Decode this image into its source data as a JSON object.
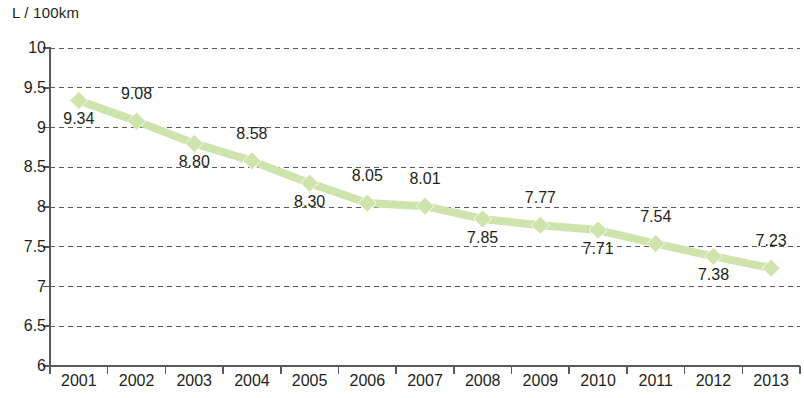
{
  "chart_data": {
    "type": "line",
    "title": "",
    "xlabel": "",
    "ylabel": "L / 100km",
    "ylim": [
      6,
      10
    ],
    "ytick_step": 0.5,
    "grid": true,
    "legend": null,
    "categories": [
      "2001",
      "2002",
      "2003",
      "2004",
      "2005",
      "2006",
      "2007",
      "2008",
      "2009",
      "2010",
      "2011",
      "2012",
      "2013"
    ],
    "values": [
      9.34,
      9.08,
      8.8,
      8.58,
      8.3,
      8.05,
      8.01,
      7.85,
      7.77,
      7.71,
      7.54,
      7.38,
      7.23
    ],
    "value_labels": [
      "9.34",
      "9.08",
      "8.80",
      "8.58",
      "8.30",
      "8.05",
      "8.01",
      "7.85",
      "7.77",
      "7.71",
      "7.54",
      "7.38",
      "7.23"
    ],
    "label_positions": [
      "below",
      "above",
      "below",
      "above",
      "below",
      "above",
      "above",
      "below",
      "above",
      "below",
      "above",
      "below",
      "above"
    ],
    "ytick_labels": [
      "10",
      "9.5",
      "9",
      "8.5",
      "8",
      "7.5",
      "7",
      "6.5",
      "6"
    ],
    "ytick_values": [
      10,
      9.5,
      9,
      8.5,
      8,
      7.5,
      7,
      6.5,
      6
    ],
    "series_color": "#cfe3ad",
    "marker_shape": "diamond",
    "axis_color": "#58595b",
    "gridline_color": "#58595b",
    "gridline_style": "dashed"
  }
}
